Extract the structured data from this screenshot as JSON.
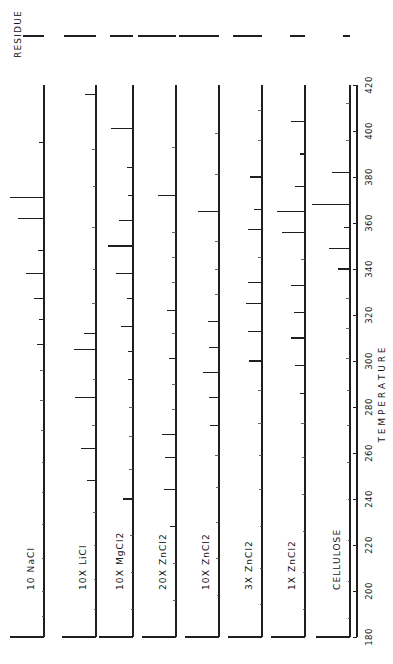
{
  "figure": {
    "residue_label": "RESIDUE",
    "axis_label": "T E M P E R A T U R E",
    "axis_label_plain": "TEMPERATURE"
  },
  "axis": {
    "min": 180,
    "max": 420,
    "step": 20,
    "ticks": [
      "180",
      "200",
      "220",
      "240",
      "260",
      "280",
      "300",
      "320",
      "340",
      "360",
      "380",
      "400",
      "420"
    ]
  },
  "chart_data": {
    "type": "line",
    "title": "",
    "subtitle": "",
    "xlabel": "TEMPERATURE",
    "ylabel": "",
    "xlim": [
      180,
      420
    ],
    "grid": false,
    "legend": "inline-trace-labels",
    "orientation": "vertical-traces-rotated-90",
    "annotations": [
      "RESIDUE"
    ],
    "note": "Eight stacked pyrolysis/thermal-evolution traces; peaks plotted as lines extending perpendicular from each vertical baseline. Peak 'temp' is the temperature position, 'height' is relative intensity 0-1.",
    "series": [
      {
        "name": "10 NaCl",
        "residue": 0.46,
        "peaks": [
          {
            "temp": 395,
            "height": 0.12
          },
          {
            "temp": 371,
            "height": 0.86
          },
          {
            "temp": 362,
            "height": 0.66
          },
          {
            "temp": 348,
            "height": 0.14
          },
          {
            "temp": 338,
            "height": 0.44
          },
          {
            "temp": 327,
            "height": 0.26
          },
          {
            "temp": 318,
            "height": 0.13
          },
          {
            "temp": 307,
            "height": 0.18
          },
          {
            "temp": 296,
            "height": 0.1
          },
          {
            "temp": 283,
            "height": 0.09
          },
          {
            "temp": 270,
            "height": 0.07
          },
          {
            "temp": 256,
            "height": 0.06
          },
          {
            "temp": 243,
            "height": 0.06
          },
          {
            "temp": 229,
            "height": 0.05
          },
          {
            "temp": 214,
            "height": 0.05
          },
          {
            "temp": 200,
            "height": 0.05
          },
          {
            "temp": 189,
            "height": 0.05
          }
        ]
      },
      {
        "name": "10X LiCl",
        "residue": 0.7,
        "peaks": [
          {
            "temp": 416,
            "height": 0.28
          },
          {
            "temp": 392,
            "height": 0.09
          },
          {
            "temp": 376,
            "height": 0.08
          },
          {
            "temp": 358,
            "height": 0.09
          },
          {
            "temp": 340,
            "height": 0.08
          },
          {
            "temp": 325,
            "height": 0.09
          },
          {
            "temp": 312,
            "height": 0.3
          },
          {
            "temp": 305,
            "height": 0.54
          },
          {
            "temp": 292,
            "height": 0.08
          },
          {
            "temp": 284,
            "height": 0.52
          },
          {
            "temp": 272,
            "height": 0.09
          },
          {
            "temp": 262,
            "height": 0.38
          },
          {
            "temp": 248,
            "height": 0.22
          },
          {
            "temp": 234,
            "height": 0.07
          },
          {
            "temp": 220,
            "height": 0.06
          },
          {
            "temp": 205,
            "height": 0.06
          },
          {
            "temp": 192,
            "height": 0.06
          }
        ]
      },
      {
        "name": "10X MgCl2",
        "residue": 0.5,
        "peaks": [
          {
            "temp": 401,
            "height": 0.56
          },
          {
            "temp": 384,
            "height": 0.16
          },
          {
            "temp": 372,
            "height": 0.12
          },
          {
            "temp": 361,
            "height": 0.36
          },
          {
            "temp": 350,
            "height": 0.62
          },
          {
            "temp": 338,
            "height": 0.42
          },
          {
            "temp": 327,
            "height": 0.14
          },
          {
            "temp": 315,
            "height": 0.3
          },
          {
            "temp": 304,
            "height": 0.13
          },
          {
            "temp": 292,
            "height": 0.12
          },
          {
            "temp": 280,
            "height": 0.11
          },
          {
            "temp": 267,
            "height": 0.1
          },
          {
            "temp": 253,
            "height": 0.09
          },
          {
            "temp": 240,
            "height": 0.26
          },
          {
            "temp": 224,
            "height": 0.07
          },
          {
            "temp": 208,
            "height": 0.06
          },
          {
            "temp": 192,
            "height": 0.06
          }
        ]
      },
      {
        "name": "20X ZnCl2",
        "residue": 0.82,
        "peaks": [
          {
            "temp": 393,
            "height": 0.1
          },
          {
            "temp": 372,
            "height": 0.44
          },
          {
            "temp": 356,
            "height": 0.11
          },
          {
            "temp": 345,
            "height": 0.1
          },
          {
            "temp": 334,
            "height": 0.09
          },
          {
            "temp": 322,
            "height": 0.22
          },
          {
            "temp": 312,
            "height": 0.11
          },
          {
            "temp": 301,
            "height": 0.17
          },
          {
            "temp": 290,
            "height": 0.1
          },
          {
            "temp": 279,
            "height": 0.1
          },
          {
            "temp": 268,
            "height": 0.34
          },
          {
            "temp": 258,
            "height": 0.28
          },
          {
            "temp": 244,
            "height": 0.3
          },
          {
            "temp": 228,
            "height": 0.14
          },
          {
            "temp": 212,
            "height": 0.08
          },
          {
            "temp": 196,
            "height": 0.07
          }
        ]
      },
      {
        "name": "10X ZnCl2",
        "residue": 0.86,
        "peaks": [
          {
            "temp": 399,
            "height": 0.1
          },
          {
            "temp": 381,
            "height": 0.09
          },
          {
            "temp": 365,
            "height": 0.52
          },
          {
            "temp": 352,
            "height": 0.11
          },
          {
            "temp": 340,
            "height": 0.1
          },
          {
            "temp": 329,
            "height": 0.09
          },
          {
            "temp": 317,
            "height": 0.28
          },
          {
            "temp": 306,
            "height": 0.24
          },
          {
            "temp": 295,
            "height": 0.4
          },
          {
            "temp": 284,
            "height": 0.26
          },
          {
            "temp": 272,
            "height": 0.22
          },
          {
            "temp": 259,
            "height": 0.1
          },
          {
            "temp": 245,
            "height": 0.08
          },
          {
            "temp": 230,
            "height": 0.07
          },
          {
            "temp": 214,
            "height": 0.07
          },
          {
            "temp": 198,
            "height": 0.06
          }
        ]
      },
      {
        "name": "3X ZnCl2",
        "residue": 0.62,
        "peaks": [
          {
            "temp": 409,
            "height": 0.1
          },
          {
            "temp": 396,
            "height": 0.09
          },
          {
            "temp": 380,
            "height": 0.3
          },
          {
            "temp": 366,
            "height": 0.2
          },
          {
            "temp": 357,
            "height": 0.36
          },
          {
            "temp": 345,
            "height": 0.1
          },
          {
            "temp": 334,
            "height": 0.34
          },
          {
            "temp": 325,
            "height": 0.4
          },
          {
            "temp": 313,
            "height": 0.36
          },
          {
            "temp": 300,
            "height": 0.32
          },
          {
            "temp": 287,
            "height": 0.1
          },
          {
            "temp": 273,
            "height": 0.09
          },
          {
            "temp": 259,
            "height": 0.08
          },
          {
            "temp": 244,
            "height": 0.07
          },
          {
            "temp": 228,
            "height": 0.06
          },
          {
            "temp": 210,
            "height": 0.06
          },
          {
            "temp": 194,
            "height": 0.06
          }
        ]
      },
      {
        "name": "1X ZnCl2",
        "residue": 0.32,
        "peaks": [
          {
            "temp": 404,
            "height": 0.36
          },
          {
            "temp": 390,
            "height": 0.12
          },
          {
            "temp": 376,
            "height": 0.24
          },
          {
            "temp": 365,
            "height": 0.7
          },
          {
            "temp": 356,
            "height": 0.58
          },
          {
            "temp": 344,
            "height": 0.11
          },
          {
            "temp": 333,
            "height": 0.34
          },
          {
            "temp": 321,
            "height": 0.28
          },
          {
            "temp": 310,
            "height": 0.36
          },
          {
            "temp": 298,
            "height": 0.26
          },
          {
            "temp": 286,
            "height": 0.12
          },
          {
            "temp": 273,
            "height": 0.1
          },
          {
            "temp": 258,
            "height": 0.08
          },
          {
            "temp": 242,
            "height": 0.07
          },
          {
            "temp": 226,
            "height": 0.06
          },
          {
            "temp": 208,
            "height": 0.06
          },
          {
            "temp": 192,
            "height": 0.06
          }
        ]
      },
      {
        "name": "CELLULOSE",
        "residue": 0.16,
        "peaks": [
          {
            "temp": 412,
            "height": 0.1
          },
          {
            "temp": 396,
            "height": 0.09
          },
          {
            "temp": 382,
            "height": 0.44
          },
          {
            "temp": 368,
            "height": 0.96
          },
          {
            "temp": 358,
            "height": 0.14
          },
          {
            "temp": 349,
            "height": 0.52
          },
          {
            "temp": 340,
            "height": 0.3
          },
          {
            "temp": 327,
            "height": 0.11
          },
          {
            "temp": 314,
            "height": 0.1
          },
          {
            "temp": 301,
            "height": 0.09
          },
          {
            "temp": 287,
            "height": 0.08
          },
          {
            "temp": 272,
            "height": 0.07
          },
          {
            "temp": 256,
            "height": 0.07
          },
          {
            "temp": 240,
            "height": 0.06
          },
          {
            "temp": 222,
            "height": 0.06
          },
          {
            "temp": 204,
            "height": 0.06
          },
          {
            "temp": 188,
            "height": 0.06
          }
        ]
      }
    ]
  }
}
